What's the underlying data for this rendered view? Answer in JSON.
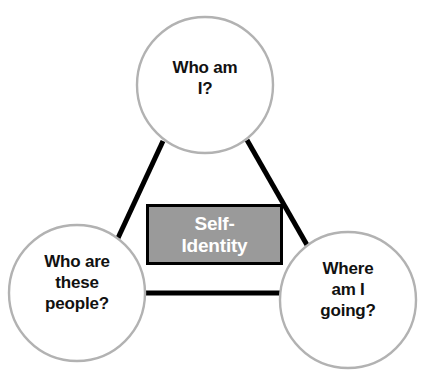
{
  "diagram": {
    "type": "triangle-concept-diagram",
    "title_fragment": "",
    "background_color": "#ffffff",
    "circle_stroke_color": "#b2b2b2",
    "circle_fill_color": "#ffffff",
    "connector_color": "#000000",
    "center_box": {
      "label": "Self-\nIdentity",
      "fill_color": "#9a9a9a",
      "border_color": "#000000",
      "text_color": "#ffffff"
    },
    "nodes": [
      {
        "id": "who-am-i",
        "label": "Who am\nI?",
        "position": "top",
        "cx": 205,
        "cy": 85,
        "r": 68
      },
      {
        "id": "who-are-these-people",
        "label": "Who are\nthese\npeople?",
        "position": "bottom-left",
        "cx": 77,
        "cy": 293,
        "r": 68
      },
      {
        "id": "where-am-i-going",
        "label": "Where\nam I\ngoing?",
        "position": "bottom-right",
        "cx": 348,
        "cy": 300,
        "r": 68
      }
    ],
    "connectors": [
      {
        "id": "connector-top-to-left",
        "from": "who-am-i",
        "to": "who-are-these-people"
      },
      {
        "id": "connector-top-to-right",
        "from": "who-am-i",
        "to": "where-am-i-going"
      },
      {
        "id": "connector-left-to-right",
        "from": "who-are-these-people",
        "to": "where-am-i-going"
      }
    ]
  }
}
